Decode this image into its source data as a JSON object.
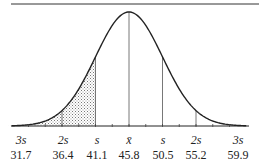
{
  "chart_data": {
    "type": "area",
    "title": "",
    "xlabel": "",
    "ylabel": "",
    "mean": 45.8,
    "sd": 4.7,
    "tick_symbols": [
      "3s",
      "2s",
      "s",
      "x̄",
      "s",
      "2s",
      "3s"
    ],
    "tick_values": [
      "31.7",
      "36.4",
      "41.1",
      "45.8",
      "50.5",
      "55.2",
      "59.9"
    ],
    "x": [
      31.7,
      36.4,
      41.1,
      45.8,
      50.5,
      55.2,
      59.9
    ],
    "shaded_region": [
      31.7,
      41.1
    ],
    "vertical_lines_at": [
      36.4,
      41.1,
      45.8,
      50.5,
      55.2
    ],
    "grid": false,
    "legend": null
  },
  "colors": {
    "line": "#222222",
    "shade": "#999999"
  }
}
